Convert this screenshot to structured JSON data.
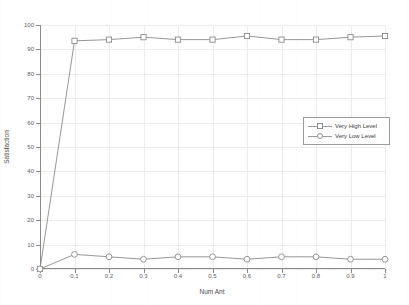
{
  "chart_data": {
    "type": "line",
    "title": "",
    "xlabel": "Num Ant",
    "ylabel": "Satisfaction",
    "xlim": [
      0,
      1
    ],
    "ylim": [
      0,
      100
    ],
    "grid": true,
    "legend_position": "center-right",
    "xticks": [
      "0",
      "0.1",
      "0.2",
      "0.3",
      "0.4",
      "0.5",
      "0.6",
      "0.7",
      "0.8",
      "0.9",
      "1"
    ],
    "xtick_values": [
      0,
      0.1,
      0.2,
      0.3,
      0.4,
      0.5,
      0.6,
      0.7,
      0.8,
      0.9,
      1
    ],
    "yticks": [
      "0",
      "10",
      "20",
      "30",
      "40",
      "50",
      "60",
      "70",
      "80",
      "90",
      "100"
    ],
    "ytick_values": [
      0,
      10,
      20,
      30,
      40,
      50,
      60,
      70,
      80,
      90,
      100
    ],
    "x": [
      0,
      0.1,
      0.2,
      0.3,
      0.4,
      0.5,
      0.6,
      0.7,
      0.8,
      0.9,
      1
    ],
    "series": [
      {
        "name": "Very High Level",
        "marker": "square",
        "color": "#8a8a8a",
        "values": [
          0,
          93.5,
          94,
          95,
          94,
          94,
          95.5,
          94,
          94,
          95,
          95.5
        ]
      },
      {
        "name": "Very Low Level",
        "marker": "circle",
        "color": "#8a8a8a",
        "values": [
          0,
          6,
          5,
          4,
          5,
          5,
          4,
          5,
          5,
          4,
          4
        ]
      }
    ]
  },
  "legend": {
    "entries": [
      {
        "label": "Very High Level",
        "marker": "square"
      },
      {
        "label": "Very Low Level",
        "marker": "circle"
      }
    ]
  }
}
